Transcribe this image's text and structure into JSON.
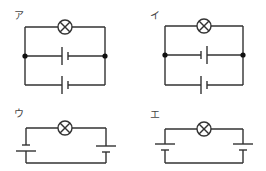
{
  "diagram": {
    "type": "circuit-diagrams",
    "colors": {
      "wire": "#333333",
      "background": "#ffffff",
      "junction": "#111111"
    },
    "circuits": [
      {
        "id": "a",
        "label": "ア",
        "description": "Lamp in top branch; two batteries in parallel branches, same orientation",
        "components": [
          "lamp",
          "battery",
          "battery"
        ],
        "connection": "batteries-parallel",
        "battery_orientation": [
          "long-left",
          "long-left"
        ],
        "junctions": 2
      },
      {
        "id": "i",
        "label": "イ",
        "description": "Lamp in top branch; two batteries in parallel branches, opposite orientation",
        "components": [
          "lamp",
          "battery",
          "battery"
        ],
        "connection": "batteries-parallel",
        "battery_orientation": [
          "long-right",
          "long-left"
        ],
        "junctions": 2
      },
      {
        "id": "u",
        "label": "ウ",
        "description": "Lamp with two batteries in series on left and right sides",
        "components": [
          "lamp",
          "battery",
          "battery"
        ],
        "connection": "batteries-series",
        "battery_orientation": [
          "long-bottom",
          "long-top"
        ],
        "junctions": 0
      },
      {
        "id": "e",
        "label": "エ",
        "description": "Lamp with two batteries in series on left and right sides, same vertical orientation",
        "components": [
          "lamp",
          "battery",
          "battery"
        ],
        "connection": "batteries-series",
        "battery_orientation": [
          "long-top",
          "long-top"
        ],
        "junctions": 0
      }
    ]
  }
}
